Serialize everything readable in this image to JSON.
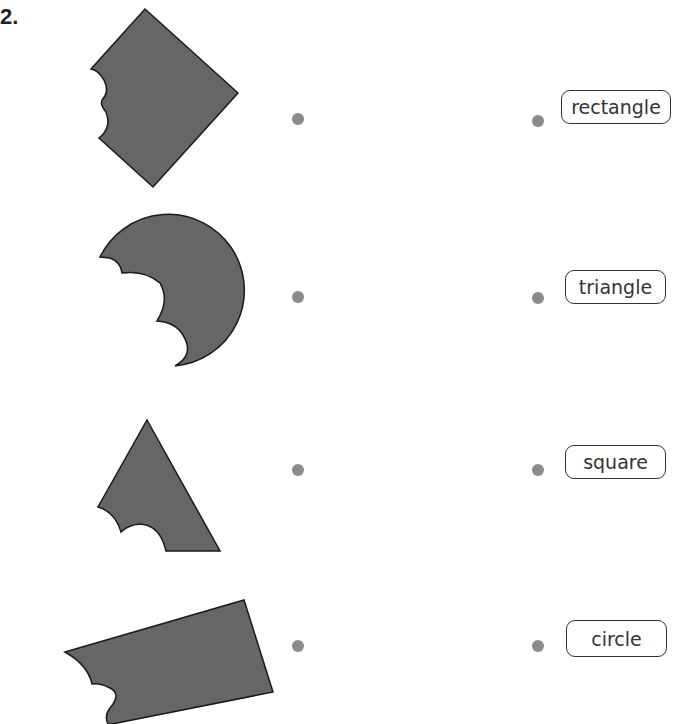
{
  "question": {
    "number": "2."
  },
  "colors": {
    "shape_fill": "#666666",
    "shape_stroke": "#1a1a1a",
    "dot": "#8a8a8a",
    "box_border": "#333333"
  },
  "shapes": [
    {
      "name": "square",
      "description": "rotated square (diamond) with bite marks on left"
    },
    {
      "name": "circle",
      "description": "circle with bite marks on left"
    },
    {
      "name": "triangle",
      "description": "triangle with bite marks on lower left"
    },
    {
      "name": "rectangle",
      "description": "tilted rectangle with bite marks on left"
    }
  ],
  "labels": [
    {
      "text": "rectangle"
    },
    {
      "text": "triangle"
    },
    {
      "text": "square"
    },
    {
      "text": "circle"
    }
  ]
}
